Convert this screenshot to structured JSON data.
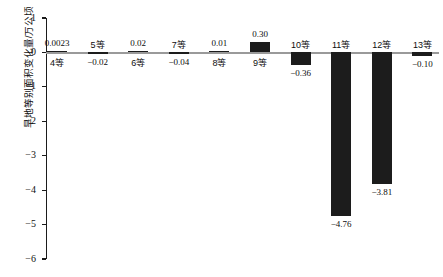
{
  "chart_data": {
    "type": "bar",
    "title": "",
    "xlabel": "",
    "ylabel": "旱地等别面积变化量/万公顷",
    "ylim": [
      -6,
      1
    ],
    "yticks": [
      1,
      0,
      -1,
      -2,
      -3,
      -4,
      -5,
      -6
    ],
    "ytick_labels": [
      "1",
      "0",
      "−1",
      "−2",
      "−3",
      "−4",
      "−5",
      "−6"
    ],
    "grid": false,
    "legend": "none",
    "bar_color": "#1c1c1c",
    "axis_color": "#1b1b1b",
    "zero_line_color": "#9a9a9a",
    "categories": [
      "4等",
      "5等",
      "6等",
      "7等",
      "8等",
      "9等",
      "10等",
      "11等",
      "12等",
      "13等"
    ],
    "values": [
      0.0023,
      -0.02,
      0.02,
      -0.04,
      0.01,
      0.3,
      -0.36,
      -4.76,
      -3.81,
      -0.1
    ],
    "value_labels": [
      "0.0023",
      "−0.02",
      "0.02",
      "−0.04",
      "0.01",
      "0.30",
      "−0.36",
      "−4.76",
      "−3.81",
      "−0.10"
    ],
    "points": [
      {
        "category": "4等",
        "value": 0.0023,
        "value_label": "0.0023",
        "value_label_pos": "above",
        "category_label_pos": "below"
      },
      {
        "category": "5等",
        "value": -0.02,
        "value_label": "−0.02",
        "value_label_pos": "below",
        "category_label_pos": "above"
      },
      {
        "category": "6等",
        "value": 0.02,
        "value_label": "0.02",
        "value_label_pos": "above",
        "category_label_pos": "below"
      },
      {
        "category": "7等",
        "value": -0.04,
        "value_label": "−0.04",
        "value_label_pos": "below",
        "category_label_pos": "above"
      },
      {
        "category": "8等",
        "value": 0.01,
        "value_label": "0.01",
        "value_label_pos": "above",
        "category_label_pos": "below"
      },
      {
        "category": "9等",
        "value": 0.3,
        "value_label": "0.30",
        "value_label_pos": "above",
        "category_label_pos": "below"
      },
      {
        "category": "10等",
        "value": -0.36,
        "value_label": "−0.36",
        "value_label_pos": "below",
        "category_label_pos": "above"
      },
      {
        "category": "11等",
        "value": -4.76,
        "value_label": "−4.76",
        "value_label_pos": "below",
        "category_label_pos": "above"
      },
      {
        "category": "12等",
        "value": -3.81,
        "value_label": "−3.81",
        "value_label_pos": "below",
        "category_label_pos": "above"
      },
      {
        "category": "13等",
        "value": -0.1,
        "value_label": "−0.10",
        "value_label_pos": "below",
        "category_label_pos": "above"
      }
    ]
  }
}
